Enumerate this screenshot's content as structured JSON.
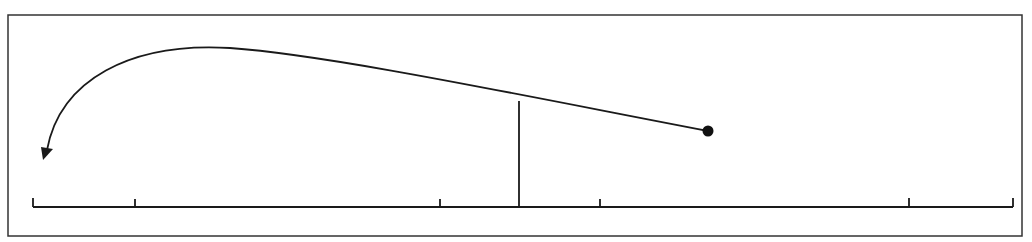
{
  "diagram": {
    "type": "number-line-with-arrow",
    "colors": {
      "background": "#ffffff",
      "stroke": "#1a1a1a",
      "frame": "#333333"
    },
    "frame": {
      "x": 8,
      "y": 15,
      "width": 1014,
      "height": 221
    },
    "number_line": {
      "y": 207,
      "x_start": 33,
      "x_end": 1013,
      "ticks": [
        {
          "x": 33,
          "height": 9
        },
        {
          "x": 135,
          "height": 8
        },
        {
          "x": 440,
          "height": 8
        },
        {
          "x": 600,
          "height": 8
        },
        {
          "x": 909,
          "height": 9
        },
        {
          "x": 1013,
          "height": 9
        }
      ]
    },
    "vertical_marker": {
      "x": 519,
      "y_top": 101,
      "y_bottom": 207
    },
    "point": {
      "x": 708,
      "y": 131,
      "radius": 5.5
    },
    "curved_arrow": {
      "from": "point",
      "path": "M 708 131 C 520 95, 330 55, 230 48 C 130 42, 60 80, 47 150",
      "arrowhead": {
        "tip_x": 45,
        "tip_y": 160
      }
    },
    "labels": []
  }
}
